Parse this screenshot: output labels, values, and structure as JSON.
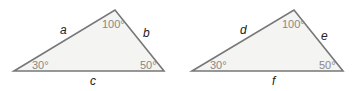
{
  "triangles": [
    {
      "id": "triangle-1",
      "vertices": {
        "left": [
          14,
          71
        ],
        "top": [
          115,
          10
        ],
        "right": [
          164,
          71
        ]
      },
      "sides": {
        "upper_left": "a",
        "upper_right": "b",
        "base": "c"
      },
      "angles": {
        "left": "30°",
        "top": "100°",
        "right": "50°"
      }
    },
    {
      "id": "triangle-2",
      "vertices": {
        "left": [
          192,
          71
        ],
        "top": [
          294,
          10
        ],
        "right": [
          343,
          71
        ]
      },
      "sides": {
        "upper_left": "d",
        "upper_right": "e",
        "base": "f"
      },
      "angles": {
        "left": "30°",
        "top": "100°",
        "right": "50°"
      }
    }
  ],
  "colors": {
    "fill": "#f4f4f2",
    "stroke": "#777777",
    "side_text": "#222222",
    "angle_text": "#888888"
  }
}
